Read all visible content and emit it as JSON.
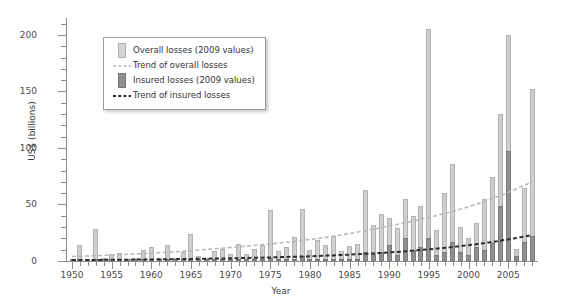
{
  "chart_data": {
    "type": "bar",
    "title": "",
    "xlabel": "Year",
    "ylabel": "US$ (billions)",
    "ylim": [
      0,
      215
    ],
    "yticks": [
      0,
      50,
      100,
      150,
      200
    ],
    "ytick_labels": [
      "0",
      "50",
      "100",
      "150",
      "200"
    ],
    "xlim": [
      1950,
      2008
    ],
    "xticks": [
      1950,
      1955,
      1960,
      1965,
      1970,
      1975,
      1980,
      1985,
      1990,
      1995,
      2000,
      2005
    ],
    "xtick_labels": [
      "1950",
      "1955",
      "1960",
      "1965",
      "1970",
      "1975",
      "1980",
      "1985",
      "1990",
      "1995",
      "2000",
      "2005"
    ],
    "grid": false,
    "legend_position": "top-left",
    "categories": [
      1950,
      1951,
      1952,
      1953,
      1954,
      1955,
      1956,
      1957,
      1958,
      1959,
      1960,
      1961,
      1962,
      1963,
      1964,
      1965,
      1966,
      1967,
      1968,
      1969,
      1970,
      1971,
      1972,
      1973,
      1974,
      1975,
      1976,
      1977,
      1978,
      1979,
      1980,
      1981,
      1982,
      1983,
      1984,
      1985,
      1986,
      1987,
      1988,
      1989,
      1990,
      1991,
      1992,
      1993,
      1994,
      1995,
      1996,
      1997,
      1998,
      1999,
      2000,
      2001,
      2002,
      2003,
      2004,
      2005,
      2006,
      2007,
      2008
    ],
    "series": [
      {
        "name": "Overall losses (2009 values)",
        "color": "#cfcfcf",
        "values": [
          2,
          14,
          2,
          28,
          3,
          6,
          7,
          2,
          3,
          10,
          12,
          3,
          14,
          3,
          8,
          24,
          4,
          3,
          9,
          11,
          6,
          15,
          6,
          11,
          14,
          45,
          9,
          12,
          21,
          46,
          10,
          19,
          14,
          22,
          9,
          13,
          15,
          63,
          32,
          42,
          38,
          29,
          55,
          40,
          49,
          205,
          27,
          60,
          86,
          30,
          20,
          34,
          55,
          74,
          130,
          200,
          11,
          65,
          152
        ]
      },
      {
        "name": "Insured losses (2009 values)",
        "color": "#8f8f8f",
        "values": [
          0,
          1,
          0,
          2,
          0,
          1,
          0,
          0,
          0,
          1,
          1,
          0,
          2,
          0,
          1,
          2,
          0,
          0,
          1,
          1,
          0,
          1,
          0,
          1,
          1,
          3,
          1,
          1,
          2,
          4,
          1,
          2,
          1,
          2,
          1,
          2,
          2,
          8,
          6,
          8,
          14,
          5,
          20,
          10,
          12,
          20,
          5,
          8,
          17,
          8,
          5,
          12,
          10,
          16,
          49,
          97,
          4,
          17,
          22
        ]
      }
    ],
    "trend_lines": [
      {
        "name": "Trend of overall losses",
        "color": "#b6b6b6",
        "style": "dashed",
        "points": [
          [
            1950,
            4
          ],
          [
            1960,
            7
          ],
          [
            1970,
            12
          ],
          [
            1980,
            19
          ],
          [
            1990,
            31
          ],
          [
            2000,
            48
          ],
          [
            2008,
            70
          ]
        ]
      },
      {
        "name": "Trend of insured losses",
        "color": "#2f2f2f",
        "style": "dashed",
        "points": [
          [
            1950,
            0.8
          ],
          [
            1960,
            1.4
          ],
          [
            1970,
            2.4
          ],
          [
            1980,
            4.2
          ],
          [
            1990,
            7.6
          ],
          [
            2000,
            14
          ],
          [
            2008,
            23
          ]
        ]
      }
    ]
  },
  "legend": {
    "items": [
      {
        "key": "swatch-overall",
        "label": "Overall losses (2009 values)"
      },
      {
        "key": "dash-overall",
        "label": "Trend of overall losses"
      },
      {
        "key": "swatch-insured",
        "label": "Insured losses (2009 values)"
      },
      {
        "key": "dash-insured",
        "label": "Trend of insured losses"
      }
    ]
  }
}
